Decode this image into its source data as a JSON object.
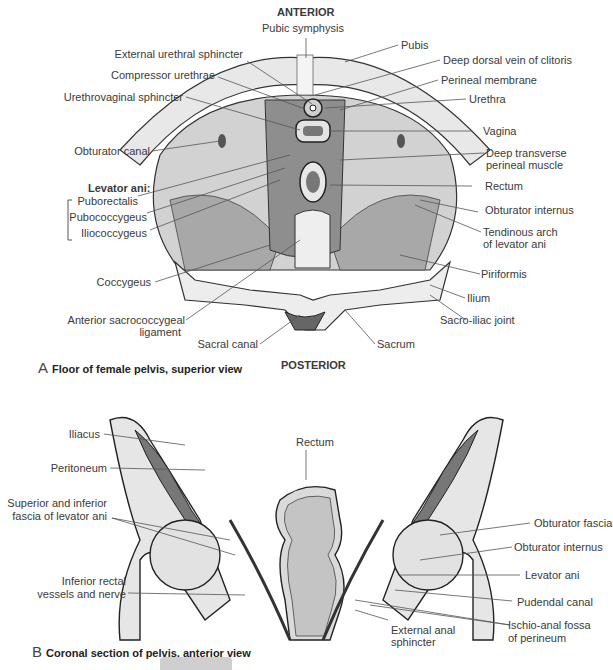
{
  "figure_a": {
    "top_heading": "ANTERIOR",
    "bottom_heading": "POSTERIOR",
    "caption_letter": "A",
    "caption": "Floor of female pelvis, superior view",
    "labels_left": [
      "External urethral sphincter",
      "Compressor urethrae",
      "Urethrovaginal sphincter",
      "Obturator canal",
      "Coccygeus",
      "Anterior sacrococcygeal",
      "ligament",
      "Sacral canal"
    ],
    "levator_group": {
      "title": "Levator ani:",
      "items": [
        "Puborectalis",
        "Pubococcygeus",
        "Iliococcygeus"
      ]
    },
    "labels_right": [
      "Pubic symphysis",
      "Pubis",
      "Deep dorsal vein of clitoris",
      "Perineal membrane",
      "Urethra",
      "Vagina",
      "Deep transverse",
      "perineal muscle",
      "Rectum",
      "Obturator internus",
      "Tendinous arch",
      "of levator ani",
      "Piriformis",
      "Ilium",
      "Sacro-iliac joint",
      "Sacrum"
    ]
  },
  "figure_b": {
    "caption_letter": "B",
    "caption": "Coronal section of pelvis, anterior view",
    "labels_left": [
      "Iliacus",
      "Peritoneum",
      "Superior and inferior",
      "fascia of levator ani",
      "Inferior rectal",
      "vessels and nerve"
    ],
    "labels_center": [
      "Rectum"
    ],
    "labels_right": [
      "Obturator fascia",
      "Obturator internus",
      "Levator ani",
      "Pudendal canal",
      "Ischio-anal fossa",
      "of perineum",
      "External anal",
      "sphincter"
    ]
  },
  "colors": {
    "text": "#3a3a3a",
    "bone": "#e6e6e6",
    "muscle": "#9a9a9a",
    "outline": "#222222",
    "footer_pill": "#cfcfcf"
  }
}
